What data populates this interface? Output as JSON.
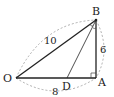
{
  "diagram": {
    "type": "geometry-right-triangle",
    "points": {
      "O": {
        "label": "O",
        "x": 16,
        "y": 78
      },
      "A": {
        "label": "A",
        "x": 96,
        "y": 78
      },
      "B": {
        "label": "B",
        "x": 96,
        "y": 20
      },
      "D": {
        "label": "D",
        "x": 67,
        "y": 78
      }
    },
    "segments": [
      {
        "from": "O",
        "to": "B",
        "bold": true
      },
      {
        "from": "O",
        "to": "A",
        "bold": true
      },
      {
        "from": "A",
        "to": "B",
        "bold": true
      },
      {
        "from": "B",
        "to": "D",
        "bold": false
      }
    ],
    "measures": {
      "OB": "10",
      "AB": "6",
      "OA": "8"
    },
    "right_angle_at": "A",
    "equal_angle_marks_at": "B",
    "colors": {
      "line": "#222222",
      "dashed": "#999999"
    }
  }
}
